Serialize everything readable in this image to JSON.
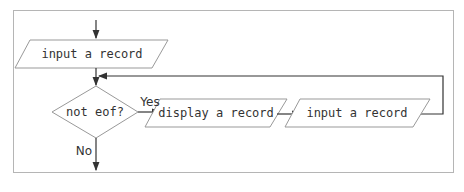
{
  "diagram": {
    "type": "flowchart",
    "nodes": {
      "input1": {
        "shape": "parallelogram",
        "label": "input a record"
      },
      "decision": {
        "shape": "diamond",
        "label": "not eof?"
      },
      "display": {
        "shape": "parallelogram",
        "label": "display a record"
      },
      "input2": {
        "shape": "parallelogram",
        "label": "input a record"
      }
    },
    "edges": {
      "yes_label": "Yes",
      "no_label": "No"
    },
    "colors": {
      "stroke": "#999999",
      "arrow": "#333333",
      "frame": "#b5b5b5",
      "text": "#333333"
    }
  }
}
